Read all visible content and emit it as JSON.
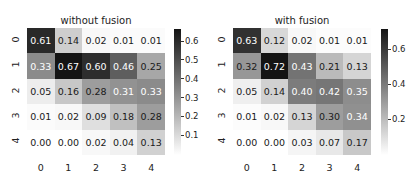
{
  "chart_data": [
    {
      "type": "heatmap",
      "title": "without fusion",
      "xlabel": "",
      "ylabel": "",
      "x_tick_labels": [
        "0",
        "1",
        "2",
        "3",
        "4"
      ],
      "y_tick_labels": [
        "0",
        "1",
        "2",
        "3",
        "4"
      ],
      "values": [
        [
          0.61,
          0.14,
          0.02,
          0.01,
          0.01
        ],
        [
          0.33,
          0.67,
          0.6,
          0.46,
          0.25
        ],
        [
          0.05,
          0.16,
          0.28,
          0.31,
          0.33
        ],
        [
          0.01,
          0.02,
          0.09,
          0.18,
          0.28
        ],
        [
          0.0,
          0.0,
          0.02,
          0.04,
          0.13
        ]
      ],
      "colormap": "Greys",
      "colorbar": {
        "min": 0.0,
        "max": 0.67,
        "ticks": [
          "0.6",
          "0.5",
          "0.4",
          "0.3",
          "0.2",
          "0.1"
        ],
        "tick_values": [
          0.6,
          0.5,
          0.4,
          0.3,
          0.2,
          0.1
        ]
      },
      "annotated": true
    },
    {
      "type": "heatmap",
      "title": "with fusion",
      "xlabel": "",
      "ylabel": "",
      "x_tick_labels": [
        "0",
        "1",
        "2",
        "3",
        "4"
      ],
      "y_tick_labels": [
        "0",
        "1",
        "2",
        "3",
        "4"
      ],
      "values": [
        [
          0.63,
          0.12,
          0.02,
          0.01,
          0.01
        ],
        [
          0.32,
          0.72,
          0.43,
          0.21,
          0.13
        ],
        [
          0.05,
          0.14,
          0.4,
          0.42,
          0.35
        ],
        [
          0.01,
          0.02,
          0.13,
          0.3,
          0.34
        ],
        [
          0.0,
          0.0,
          0.03,
          0.07,
          0.17
        ]
      ],
      "colormap": "Greys",
      "colorbar": {
        "min": 0.0,
        "max": 0.72,
        "ticks": [
          "0.6",
          "0.4",
          "0.2"
        ],
        "tick_values": [
          0.6,
          0.4,
          0.2
        ]
      },
      "annotated": true
    }
  ]
}
